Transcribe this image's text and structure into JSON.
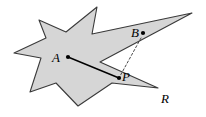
{
  "figure": {
    "caption_labels": {
      "region": "R",
      "interior_point": "A",
      "exterior_point": "B",
      "boundary_point": "P"
    },
    "colors": {
      "region_fill": "#d6d6d6",
      "region_stroke": "#3a3a3a",
      "segment_stroke": "#000000",
      "dashed_stroke": "#555555",
      "point_marker": "#000000",
      "background": "#ffffff"
    },
    "labels": [
      {
        "name": "label-A",
        "text": "A",
        "x": 52,
        "y": 51
      },
      {
        "name": "label-B",
        "text": "B",
        "x": 131,
        "y": 26
      },
      {
        "name": "label-P",
        "text": "P",
        "x": 122,
        "y": 70
      },
      {
        "name": "label-R",
        "text": "R",
        "x": 161,
        "y": 92
      }
    ],
    "points": [
      {
        "name": "point-A",
        "label": "A",
        "x": 68,
        "y": 57
      },
      {
        "name": "point-B",
        "label": "B",
        "x": 143,
        "y": 33
      },
      {
        "name": "point-P",
        "label": "P",
        "x": 119,
        "y": 78
      }
    ],
    "segments": [
      {
        "name": "segment-A-P",
        "style": "solid",
        "from": "A",
        "to": "P",
        "x1": 68,
        "y1": 57,
        "x2": 119,
        "y2": 78
      },
      {
        "name": "segment-B-P",
        "style": "dashed",
        "from": "B",
        "to": "P",
        "x1": 141,
        "y1": 38,
        "x2": 119,
        "y2": 77
      }
    ],
    "region_polygon_points": "97,7 92,34 192,13 100,62 158,88 112,83 78,106 56,83 30,92 41,58 14,53 46,38 39,20 66,32",
    "dimensions": {
      "width": 206,
      "height": 117
    }
  }
}
